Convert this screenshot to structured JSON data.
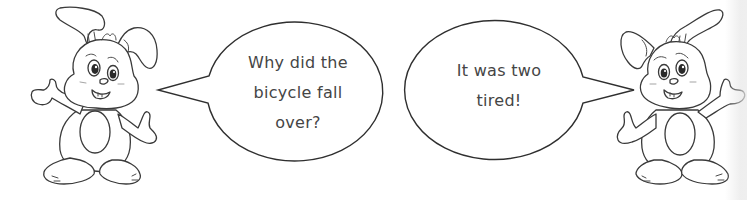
{
  "scene": {
    "title": "Bicycle joke comic",
    "characters": [
      {
        "name": "left-bunny",
        "role": "asker"
      },
      {
        "name": "right-bunny",
        "role": "answerer"
      }
    ],
    "speech_bubbles": [
      {
        "speaker": "left-bunny",
        "lines": [
          "Why did the",
          "bicycle fall",
          "over?"
        ]
      },
      {
        "speaker": "right-bunny",
        "lines": [
          "It was two",
          "tired!"
        ]
      }
    ],
    "colors": {
      "background": "#ffffff",
      "outline": "#2f2f2f",
      "text": "#454545"
    }
  }
}
